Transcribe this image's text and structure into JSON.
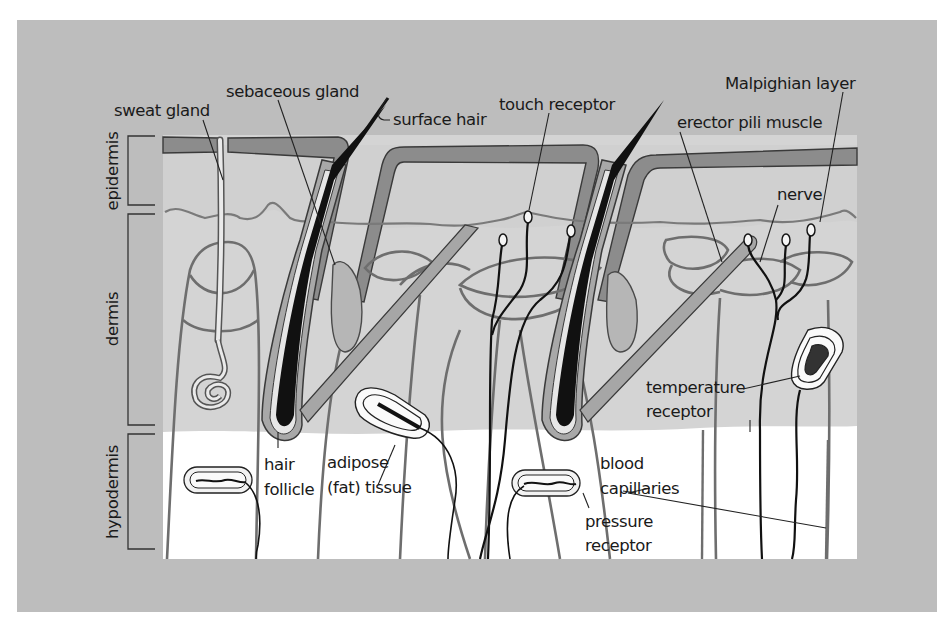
{
  "figure": {
    "colors": {
      "page_background": "#ffffff",
      "panel_background": "#bdbdbd",
      "dermis_fill": "#d4d4d4",
      "hypodermis_fill": "#ffffff",
      "epidermis_band": "#8c8c8c",
      "outline": "#6a6a6a",
      "hair": "#111111",
      "label_text": "#1a1a1a"
    }
  },
  "layers": [
    {
      "id": "epidermis",
      "label": "epidermis"
    },
    {
      "id": "dermis",
      "label": "dermis"
    },
    {
      "id": "hypodermis",
      "label": "hypodermis"
    }
  ],
  "labels": {
    "sweat_gland": "sweat gland",
    "sebaceous_gland": "sebaceous gland",
    "surface_hair": "surface hair",
    "touch_receptor": "touch receptor",
    "malpighian_layer": "Malpighian layer",
    "erector_pili_muscle": "erector pili muscle",
    "nerve": "nerve",
    "temperature_receptor_1": "temperature",
    "temperature_receptor_2": "receptor",
    "hair_follicle_1": "hair",
    "hair_follicle_2": "follicle",
    "adipose_1": "adipose",
    "adipose_2": "(fat) tissue",
    "blood_capillaries_1": "blood",
    "blood_capillaries_2": "capillaries",
    "pressure_receptor_1": "pressure",
    "pressure_receptor_2": "receptor"
  }
}
